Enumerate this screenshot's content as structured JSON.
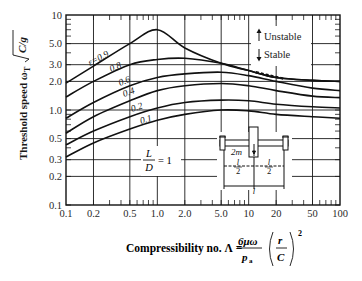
{
  "chart_data": {
    "type": "line",
    "title": "",
    "xlabel": "Compressibility no. Λ = (6μω / p_a)(r / C)²",
    "ylabel": "Threshold speed ω_T √(C/g)",
    "xscale": "log",
    "yscale": "log",
    "xlim": [
      0.1,
      100
    ],
    "ylim": [
      0.1,
      10
    ],
    "grid": true,
    "x_ticks": [
      "0.1",
      "0.2",
      "0.5",
      "1.0",
      "2.0",
      "5.0",
      "10",
      "20",
      "50",
      "100"
    ],
    "y_ticks": [
      "10",
      "5.0",
      "3.0",
      "2.0",
      "1.0",
      "0.5",
      "0.3",
      "0.2",
      "0.1"
    ],
    "x": [
      0.1,
      0.2,
      0.5,
      1.0,
      2.0,
      5.0,
      10,
      20,
      50,
      100
    ],
    "series": [
      {
        "name": "ε=0.9",
        "values": [
          1.92,
          2.9,
          5.0,
          7.0,
          4.5,
          3.1,
          2.6,
          2.2,
          2.05,
          2.0
        ]
      },
      {
        "name": "ε=0.8",
        "values": [
          1.37,
          2.0,
          3.0,
          3.4,
          3.5,
          3.1,
          2.6,
          2.2,
          2.05,
          2.0
        ]
      },
      {
        "name": "ε=0.6",
        "values": [
          0.82,
          1.2,
          1.8,
          2.2,
          2.4,
          2.5,
          2.3,
          2.0,
          1.7,
          1.6
        ]
      },
      {
        "name": "ε=0.4",
        "values": [
          0.57,
          0.85,
          1.25,
          1.6,
          1.8,
          1.9,
          1.8,
          1.6,
          1.4,
          1.35
        ]
      },
      {
        "name": "ε=0.2",
        "values": [
          0.43,
          0.6,
          0.85,
          1.05,
          1.2,
          1.27,
          1.25,
          1.15,
          1.08,
          1.05
        ]
      },
      {
        "name": "ε=0.1",
        "values": [
          0.32,
          0.45,
          0.63,
          0.78,
          0.9,
          1.0,
          0.98,
          0.9,
          0.85,
          0.82
        ]
      }
    ],
    "annotations": [
      "ε=0.9",
      "0.8",
      "0.6",
      "0.4",
      "0.2",
      "0.1",
      "L/D = 1",
      "↑ Unstable",
      "↓ Stable",
      "2m",
      "l/2",
      "l/2",
      "l"
    ],
    "legend": {
      "position": "upper-right",
      "entries": [
        "Unstable",
        "Stable"
      ]
    }
  },
  "labels": {
    "ylabel_main": "Threshold speed ω",
    "ylabel_sub": "T",
    "ylabel_sqrt": "C/g",
    "xlabel_prefix": "Compressibility no. Λ = ",
    "x_frac_num": "6μω",
    "x_frac_den": "p",
    "x_frac_den_sub": "a",
    "x_paren_num": "r",
    "x_paren_den": "C",
    "x_exp": "2",
    "unstable": "Unstable",
    "stable": "Stable",
    "ld_num": "L",
    "ld_den": "D",
    "ld_eq": "= 1",
    "mass": "2m",
    "half_l": "l",
    "two": "2",
    "full_l": "l",
    "eps09": "ε=0.9",
    "eps08": "0.8",
    "eps06": "0.6",
    "eps04": "0.4",
    "eps02": "0.2",
    "eps01": "0.1"
  }
}
